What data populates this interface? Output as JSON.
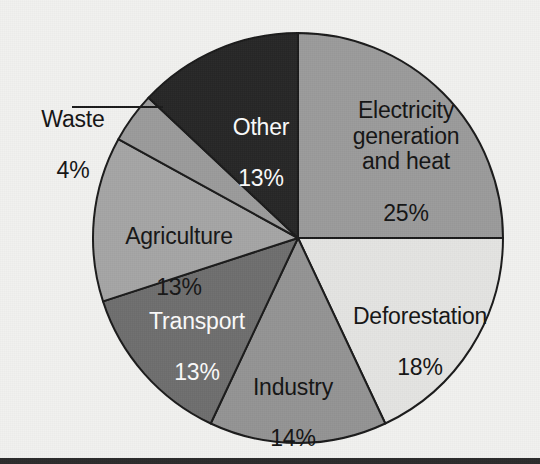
{
  "figure": {
    "background_color": "#f1f1ef",
    "bottom_bar_color": "#2b2b2b"
  },
  "chart_data": {
    "type": "pie",
    "title": "",
    "subtitle": "",
    "xlabel": "",
    "ylabel": "",
    "legend_position": "none",
    "grid": false,
    "units": "percent",
    "total": 100,
    "start_angle_deg": 0,
    "direction": "clockwise",
    "center_px": [
      298,
      238
    ],
    "radius_px": 205,
    "categories": [
      "Electricity generation and heat",
      "Deforestation",
      "Industry",
      "Transport",
      "Agriculture",
      "Waste",
      "Other"
    ],
    "values": [
      25,
      18,
      14,
      13,
      13,
      4,
      13
    ],
    "slices": [
      {
        "key": "electricity",
        "name": "Electricity generation and heat",
        "label_lines": "Electricity\ngeneration\nand heat",
        "value": 25,
        "value_text": "25%",
        "color": "#9b9b9b",
        "text_color": "#141414",
        "start_angle_deg": 0,
        "end_angle_deg": 90,
        "label_placement": "inside"
      },
      {
        "key": "deforestation",
        "name": "Deforestation",
        "label_lines": "Deforestation",
        "value": 18,
        "value_text": "18%",
        "color": "#e4e4e2",
        "text_color": "#141414",
        "start_angle_deg": 90,
        "end_angle_deg": 154.8,
        "label_placement": "inside"
      },
      {
        "key": "industry",
        "name": "Industry",
        "label_lines": "Industry",
        "value": 14,
        "value_text": "14%",
        "color": "#949494",
        "text_color": "#141414",
        "start_angle_deg": 154.8,
        "end_angle_deg": 205.2,
        "label_placement": "inside"
      },
      {
        "key": "transport",
        "name": "Transport",
        "label_lines": "Transport",
        "value": 13,
        "value_text": "13%",
        "color": "#6e6e6e",
        "text_color": "#fbfbfb",
        "start_angle_deg": 205.2,
        "end_angle_deg": 252,
        "label_placement": "inside"
      },
      {
        "key": "agriculture",
        "name": "Agriculture",
        "label_lines": "Agriculture",
        "value": 13,
        "value_text": "13%",
        "color": "#a5a5a5",
        "text_color": "#161616",
        "start_angle_deg": 252,
        "end_angle_deg": 298.8,
        "label_placement": "inside"
      },
      {
        "key": "waste",
        "name": "Waste",
        "label_lines": "Waste",
        "value": 4,
        "value_text": "4%",
        "color": "#9b9b9b",
        "text_color": "#141414",
        "start_angle_deg": 298.8,
        "end_angle_deg": 313.2,
        "label_placement": "outside-with-leader-line"
      },
      {
        "key": "other",
        "name": "Other",
        "label_lines": "Other",
        "value": 13,
        "value_text": "13%",
        "color": "#262626",
        "text_color": "#fbfbfb",
        "start_angle_deg": 313.2,
        "end_angle_deg": 360,
        "label_placement": "inside"
      }
    ],
    "leader_lines": [
      {
        "for": "waste",
        "x1": 72,
        "y1": 107,
        "x2": 163,
        "y2": 107,
        "color": "#1a1a1a"
      }
    ],
    "slice_outline_color": "#1a1a1a",
    "slice_outline_width": 2
  }
}
